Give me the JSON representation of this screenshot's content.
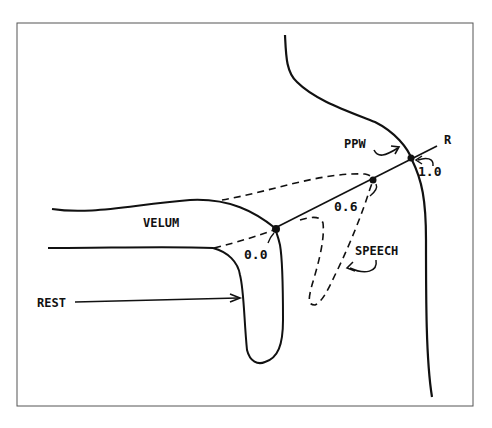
{
  "figure": {
    "frame_color": "#555555",
    "stroke_color": "#111111",
    "background": "#ffffff",
    "labels": {
      "ppw": "PPW",
      "r": "R",
      "velum": "VELUM",
      "rest": "REST",
      "speech": "SPEECH",
      "tick_0_0": "0.0",
      "tick_0_6": "0.6",
      "tick_1_0": "1.0"
    },
    "line_styles": {
      "rest": "solid",
      "speech": "dashed"
    }
  }
}
